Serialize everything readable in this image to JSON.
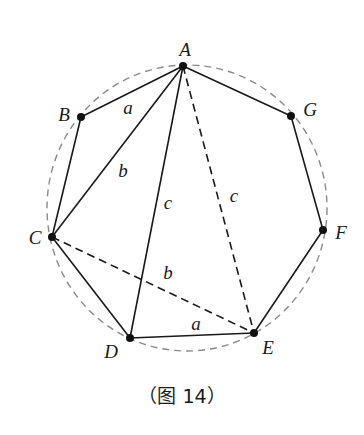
{
  "figure": {
    "caption": "（图 14）",
    "circle": {
      "cx": 187,
      "cy": 208,
      "rx": 140,
      "ry": 143,
      "style": "dashed",
      "color": "#8a8a8a"
    },
    "vertices": [
      {
        "name": "A",
        "x": 183,
        "y": 66,
        "label_x": 185,
        "label_y": 56
      },
      {
        "name": "B",
        "x": 81,
        "y": 117,
        "label_x": 64,
        "label_y": 121
      },
      {
        "name": "C",
        "x": 52,
        "y": 237,
        "label_x": 35,
        "label_y": 244
      },
      {
        "name": "D",
        "x": 130,
        "y": 338,
        "label_x": 111,
        "label_y": 358
      },
      {
        "name": "E",
        "x": 254,
        "y": 333,
        "label_x": 268,
        "label_y": 354
      },
      {
        "name": "F",
        "x": 323,
        "y": 230,
        "label_x": 341,
        "label_y": 239
      },
      {
        "name": "G",
        "x": 291,
        "y": 116,
        "label_x": 310,
        "label_y": 116
      }
    ],
    "solid_segments": [
      [
        "A",
        "B"
      ],
      [
        "B",
        "C"
      ],
      [
        "C",
        "D"
      ],
      [
        "D",
        "E"
      ],
      [
        "E",
        "F"
      ],
      [
        "F",
        "G"
      ],
      [
        "G",
        "A"
      ],
      [
        "A",
        "C"
      ],
      [
        "A",
        "D"
      ]
    ],
    "dashed_segments": [
      [
        "A",
        "E"
      ],
      [
        "C",
        "E"
      ]
    ],
    "side_labels": [
      {
        "text": "a",
        "x": 128,
        "y": 114
      },
      {
        "text": "b",
        "x": 123,
        "y": 177
      },
      {
        "text": "c",
        "x": 168,
        "y": 209
      },
      {
        "text": "c",
        "x": 234,
        "y": 202
      },
      {
        "text": "b",
        "x": 168,
        "y": 279
      },
      {
        "text": "a",
        "x": 196,
        "y": 330
      }
    ]
  }
}
